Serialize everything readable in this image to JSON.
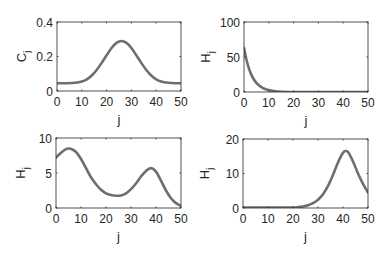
{
  "chart_data": [
    {
      "type": "line",
      "position": "top-left",
      "title": "",
      "xlabel": "j",
      "ylabel": "C_j",
      "ylabel_main": "C",
      "ylabel_sub": "j",
      "xlim": [
        0,
        50
      ],
      "ylim": [
        0,
        0.4
      ],
      "xticks": [
        0,
        10,
        20,
        30,
        40,
        50
      ],
      "yticks": [
        0,
        0.2,
        0.4
      ],
      "ytick_labels": [
        "0",
        "0.2",
        "0.4"
      ],
      "grid": false,
      "series": [
        {
          "name": "C_j",
          "x": [
            0,
            2,
            4,
            6,
            8,
            10,
            12,
            14,
            16,
            18,
            20,
            22,
            24,
            26,
            28,
            30,
            32,
            34,
            36,
            38,
            40,
            42,
            44,
            46,
            48,
            50
          ],
          "y": [
            0.045,
            0.045,
            0.045,
            0.046,
            0.049,
            0.055,
            0.068,
            0.09,
            0.122,
            0.163,
            0.207,
            0.249,
            0.279,
            0.29,
            0.279,
            0.249,
            0.207,
            0.163,
            0.122,
            0.09,
            0.068,
            0.055,
            0.049,
            0.046,
            0.045,
            0.045
          ]
        }
      ]
    },
    {
      "type": "line",
      "position": "top-right",
      "title": "",
      "xlabel": "j",
      "ylabel": "H_j",
      "ylabel_main": "H",
      "ylabel_sub": "j",
      "xlim": [
        0,
        50
      ],
      "ylim": [
        0,
        100
      ],
      "xticks": [
        0,
        10,
        20,
        30,
        40,
        50
      ],
      "yticks": [
        0,
        50,
        100
      ],
      "ytick_labels": [
        "0",
        "50",
        "100"
      ],
      "grid": false,
      "series": [
        {
          "name": "H_j",
          "x": [
            0,
            1,
            2,
            3,
            4,
            5,
            6,
            7,
            8,
            9,
            10,
            12,
            14,
            16,
            20,
            25,
            30,
            35,
            40,
            45,
            50
          ],
          "y": [
            63,
            46,
            33.5,
            24.5,
            17.8,
            13,
            9.5,
            6.9,
            5,
            3.7,
            2.7,
            1.4,
            0.75,
            0.4,
            0.1,
            0.02,
            0,
            0,
            0,
            0,
            0
          ]
        }
      ]
    },
    {
      "type": "line",
      "position": "bottom-left",
      "title": "",
      "xlabel": "j",
      "ylabel": "H_j",
      "ylabel_main": "H",
      "ylabel_sub": "j",
      "xlim": [
        0,
        50
      ],
      "ylim": [
        0,
        10
      ],
      "xticks": [
        0,
        10,
        20,
        30,
        40,
        50
      ],
      "yticks": [
        0,
        5,
        10
      ],
      "ytick_labels": [
        "0",
        "5",
        "10"
      ],
      "grid": false,
      "series": [
        {
          "name": "H_j",
          "x": [
            0,
            2,
            4,
            5,
            6,
            8,
            10,
            12,
            14,
            16,
            18,
            20,
            22,
            24,
            26,
            28,
            30,
            32,
            34,
            36,
            38,
            40,
            42,
            44,
            46,
            48,
            50
          ],
          "y": [
            7.2,
            7.9,
            8.4,
            8.5,
            8.45,
            8.0,
            7.0,
            5.7,
            4.4,
            3.4,
            2.6,
            2.1,
            1.85,
            1.75,
            1.8,
            2.1,
            2.7,
            3.5,
            4.5,
            5.3,
            5.7,
            5.2,
            3.9,
            2.5,
            1.4,
            0.7,
            0.3
          ]
        }
      ]
    },
    {
      "type": "line",
      "position": "bottom-right",
      "title": "",
      "xlabel": "j",
      "ylabel": "H_j",
      "ylabel_main": "H",
      "ylabel_sub": "j",
      "xlim": [
        0,
        50
      ],
      "ylim": [
        0,
        20
      ],
      "xticks": [
        0,
        10,
        20,
        30,
        40,
        50
      ],
      "yticks": [
        0,
        10,
        20
      ],
      "ytick_labels": [
        "0",
        "10",
        "20"
      ],
      "grid": false,
      "series": [
        {
          "name": "H_j",
          "x": [
            0,
            5,
            10,
            15,
            20,
            22,
            24,
            26,
            28,
            30,
            32,
            34,
            36,
            38,
            40,
            41,
            42,
            44,
            46,
            48,
            50
          ],
          "y": [
            0.1,
            0.1,
            0.1,
            0.1,
            0.15,
            0.25,
            0.45,
            0.8,
            1.4,
            2.4,
            4.0,
            6.4,
            9.6,
            13.2,
            16.0,
            16.5,
            16.2,
            13.5,
            10.0,
            7.0,
            4.5
          ]
        }
      ]
    }
  ],
  "panels": [
    {
      "box": [
        57,
        22,
        181,
        91
      ]
    },
    {
      "box": [
        244,
        22,
        368,
        92
      ]
    },
    {
      "box": [
        56,
        138,
        181,
        208
      ]
    },
    {
      "box": [
        243,
        139,
        368,
        208
      ]
    }
  ],
  "style": {
    "curve_color": "#6e6e6e",
    "axis_color": "#262626",
    "background": "#ffffff"
  }
}
